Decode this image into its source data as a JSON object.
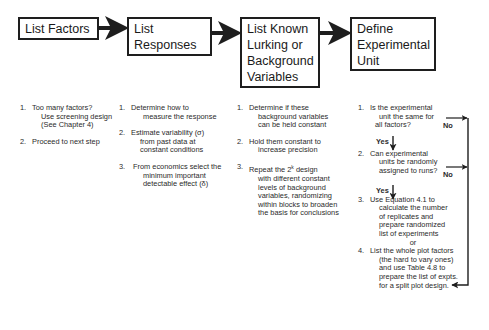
{
  "boxes": [
    {
      "lines": [
        "List Factors"
      ]
    },
    {
      "lines": [
        "List",
        "Responses"
      ]
    },
    {
      "lines": [
        "List Known",
        "Lurking or",
        "Background",
        "Variables"
      ]
    },
    {
      "lines": [
        "Define",
        "Experimental",
        "Unit"
      ]
    }
  ],
  "columns": {
    "factors": [
      {
        "num": "1.",
        "lines": [
          "Too many factors?",
          "Use screening design",
          "(See Chapter  4)"
        ]
      },
      {
        "num": "2.",
        "lines": [
          "Proceed to next step"
        ]
      }
    ],
    "responses": [
      {
        "num": "1.",
        "lines": [
          "Determine how to",
          "measure the response"
        ]
      },
      {
        "num": "2.",
        "lines": [
          "Estimate variability (σ)",
          "from past data at",
          "constant conditions"
        ]
      },
      {
        "num": "3.",
        "lines": [
          "From economics select the",
          "minimum  important",
          "detectable effect (δ)"
        ]
      }
    ],
    "lurking": [
      {
        "num": "1.",
        "lines": [
          "Determine if these",
          "background variables",
          "can be held constant"
        ]
      },
      {
        "num": "2.",
        "lines": [
          "Hold them constant to",
          "increase precision"
        ]
      },
      {
        "num": "3.",
        "lines_pre": "Repeat the 2",
        "sup": "k",
        "lines_post": " design",
        "lines": [
          "with different  constant",
          "levels of background",
          "variables, randomizing",
          "within blocks to broaden",
          "the basis for conclusions"
        ]
      }
    ],
    "unit": [
      {
        "num": "1.",
        "lines": [
          "Is the experimental",
          "unit the same for",
          "all factors?"
        ]
      },
      {
        "num": "2.",
        "lines": [
          "Can experimental",
          "units be randomly",
          "assigned to runs?"
        ]
      },
      {
        "num": "3.",
        "lines": [
          "Use Equation  4.1 to",
          "calculate the number",
          "of replicates and",
          "prepare randomized",
          "list of experiments"
        ]
      },
      {
        "or": "or"
      },
      {
        "num": "4.",
        "lines": [
          "List the whole plot factors",
          "(the hard to vary ones)",
          "and use  Table 4.8 to",
          "prepare the list of expts.",
          "for a split plot design."
        ]
      }
    ]
  },
  "flow_labels": {
    "yes1": "Yes",
    "yes2": "Yes",
    "no1": "No",
    "no2": "No"
  },
  "colors": {
    "line": "#1e1e1e",
    "text": "#2a2a2a"
  }
}
